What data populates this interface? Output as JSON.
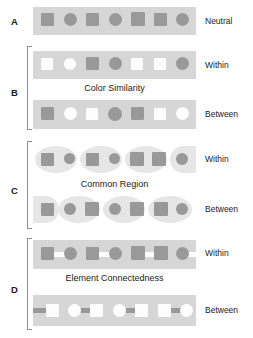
{
  "figure": {
    "background_color": "#ffffff",
    "band_color": "#d6d6d6",
    "region_color": "#e6e6e6",
    "element_gray": "#999999",
    "element_white": "#fdfdfd",
    "bracket_color": "#8d8d8d"
  },
  "panels": [
    {
      "letter": "A",
      "caption": "",
      "rows": [
        {
          "condition_label": "Neutral",
          "elements": [
            {
              "shape": "square",
              "fill": "gray"
            },
            {
              "shape": "circle",
              "fill": "gray"
            },
            {
              "shape": "square",
              "fill": "gray"
            },
            {
              "shape": "circle",
              "fill": "gray"
            },
            {
              "shape": "square",
              "fill": "gray"
            },
            {
              "shape": "square",
              "fill": "gray"
            },
            {
              "shape": "circle",
              "fill": "gray"
            }
          ]
        }
      ]
    },
    {
      "letter": "B",
      "caption": "Color Similarity",
      "rows": [
        {
          "condition_label": "Within",
          "elements": [
            {
              "shape": "square",
              "fill": "white"
            },
            {
              "shape": "circle",
              "fill": "white"
            },
            {
              "shape": "square",
              "fill": "gray"
            },
            {
              "shape": "circle",
              "fill": "gray"
            },
            {
              "shape": "square",
              "fill": "white"
            },
            {
              "shape": "square",
              "fill": "white"
            },
            {
              "shape": "circle",
              "fill": "gray"
            }
          ]
        },
        {
          "condition_label": "Between",
          "elements": [
            {
              "shape": "square",
              "fill": "gray"
            },
            {
              "shape": "circle",
              "fill": "white"
            },
            {
              "shape": "square",
              "fill": "white"
            },
            {
              "shape": "circle",
              "fill": "gray"
            },
            {
              "shape": "square",
              "fill": "gray"
            },
            {
              "shape": "square",
              "fill": "white"
            },
            {
              "shape": "circle",
              "fill": "white"
            }
          ]
        }
      ]
    },
    {
      "letter": "C",
      "caption": "Common Region",
      "rows": [
        {
          "condition_label": "Within",
          "elements": [
            {
              "shape": "square",
              "fill": "gray"
            },
            {
              "shape": "circle",
              "fill": "gray"
            },
            {
              "shape": "square",
              "fill": "gray"
            },
            {
              "shape": "circle",
              "fill": "gray"
            },
            {
              "shape": "square",
              "fill": "gray"
            },
            {
              "shape": "square",
              "fill": "gray"
            },
            {
              "shape": "circle",
              "fill": "gray"
            }
          ],
          "regions": "4 ellipses grouping pairs 1-2, 3-4, 5-6, 7 (clipped right)"
        },
        {
          "condition_label": "Between",
          "elements": [
            {
              "shape": "square",
              "fill": "gray"
            },
            {
              "shape": "circle",
              "fill": "gray"
            },
            {
              "shape": "square",
              "fill": "gray"
            },
            {
              "shape": "circle",
              "fill": "gray"
            },
            {
              "shape": "square",
              "fill": "gray"
            },
            {
              "shape": "square",
              "fill": "gray"
            },
            {
              "shape": "circle",
              "fill": "gray"
            }
          ],
          "regions": "4 ellipses offset: 1 (clipped left), 2-3, 4-5, 6-7"
        }
      ]
    },
    {
      "letter": "D",
      "caption": "Element Connectedness",
      "rows": [
        {
          "condition_label": "Within",
          "elements": [
            {
              "shape": "square",
              "fill": "gray"
            },
            {
              "shape": "circle",
              "fill": "gray"
            },
            {
              "shape": "square",
              "fill": "gray"
            },
            {
              "shape": "circle",
              "fill": "gray"
            },
            {
              "shape": "square",
              "fill": "gray"
            },
            {
              "shape": "square",
              "fill": "gray"
            },
            {
              "shape": "circle",
              "fill": "gray"
            }
          ],
          "connectors": "white bars linking pairs 1-2, 3-4, 5-6, and trailing from 7"
        },
        {
          "condition_label": "Between",
          "elements": [
            {
              "shape": "square",
              "fill": "white"
            },
            {
              "shape": "circle",
              "fill": "white"
            },
            {
              "shape": "square",
              "fill": "white"
            },
            {
              "shape": "circle",
              "fill": "white"
            },
            {
              "shape": "square",
              "fill": "white"
            },
            {
              "shape": "square",
              "fill": "white"
            },
            {
              "shape": "circle",
              "fill": "white"
            }
          ],
          "connectors": "gray bars offset: leading bar clipped at left, then linking 2-3, 4-5, 6-7"
        }
      ]
    }
  ]
}
